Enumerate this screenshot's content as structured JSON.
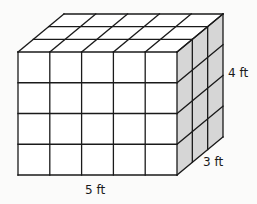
{
  "figure": {
    "type": "rectangular prism made of unit cubes",
    "dimensions": {
      "length": 5,
      "height": 4,
      "depth": 3,
      "unit": "ft"
    },
    "labels": {
      "length": "5 ft",
      "height": "4 ft",
      "depth": "3 ft"
    },
    "colors": {
      "front_face": "#ffffff",
      "top_face": "#ffffff",
      "side_face": "#d6d6d6",
      "lines": "#1a1a1a",
      "background": "#fbfbfa"
    }
  }
}
